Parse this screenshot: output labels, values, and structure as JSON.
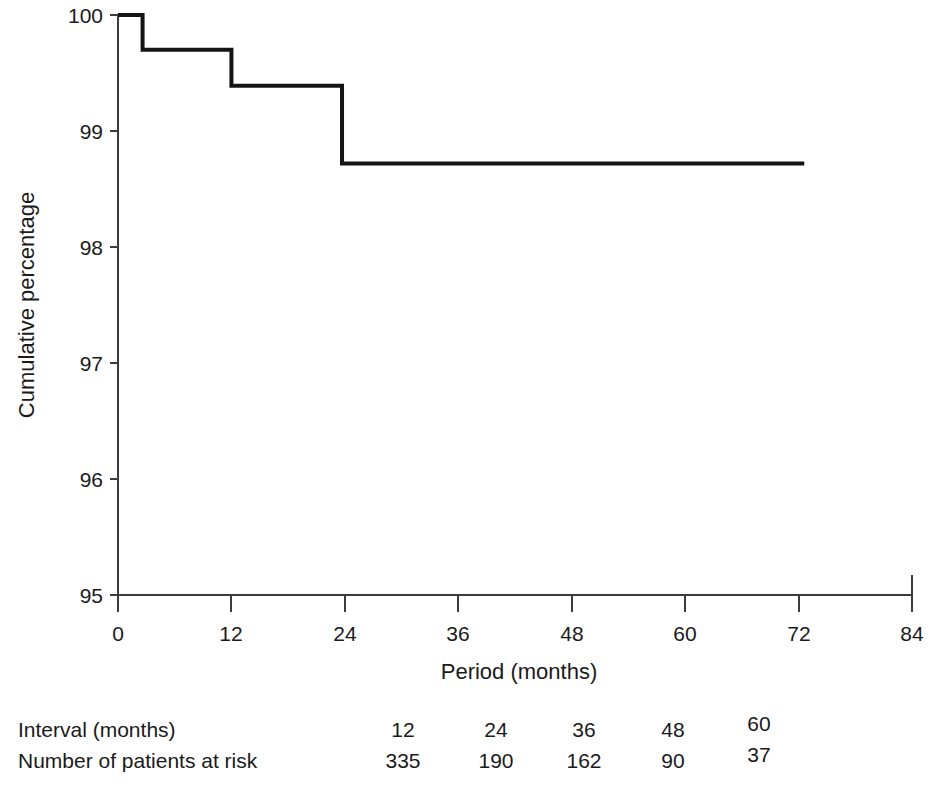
{
  "chart_data": {
    "type": "line",
    "subtype": "kaplan-meier-step",
    "title": "",
    "xlabel": "Period (months)",
    "ylabel": "Cumulative percentage",
    "xlim": [
      0,
      84
    ],
    "ylim": [
      95,
      100
    ],
    "x_ticks": [
      0,
      12,
      24,
      36,
      48,
      60,
      72,
      84
    ],
    "x_tick_labels": [
      "0",
      "12",
      "24",
      "36",
      "48",
      "60",
      "72",
      "84"
    ],
    "y_ticks": [
      95,
      96,
      97,
      98,
      99,
      100
    ],
    "y_tick_labels": [
      "95",
      "96",
      "97",
      "98",
      "99",
      "100"
    ],
    "grid": false,
    "legend": false,
    "series": [
      {
        "name": "Cumulative survival",
        "step": "post",
        "x": [
          0,
          2.6,
          2.6,
          12.0,
          12.0,
          23.7,
          23.7,
          72.6
        ],
        "y": [
          100.0,
          100.0,
          99.7,
          99.7,
          99.39,
          99.39,
          98.72,
          98.72
        ],
        "steps": [
          {
            "time": 0.0,
            "value": 100.0
          },
          {
            "time": 2.6,
            "value": 99.7
          },
          {
            "time": 12.0,
            "value": 99.39
          },
          {
            "time": 23.7,
            "value": 98.72
          },
          {
            "time": 72.6,
            "value": 98.72
          }
        ]
      }
    ]
  },
  "axes": {
    "y_title": "Cumulative percentage",
    "x_title": "Period (months)"
  },
  "risk_table": {
    "rows": [
      {
        "label": "Interval (months)",
        "values": [
          "12",
          "24",
          "36",
          "48",
          "60"
        ]
      },
      {
        "label": "Number of patients at risk",
        "values": [
          "335",
          "190",
          "162",
          "90",
          "37"
        ]
      }
    ],
    "column_positions": [
      403,
      496,
      584,
      673,
      759
    ]
  },
  "colors": {
    "curve": "#141414",
    "axis": "#3c3c3c",
    "text": "#1a1a1a",
    "background": "#ffffff"
  }
}
